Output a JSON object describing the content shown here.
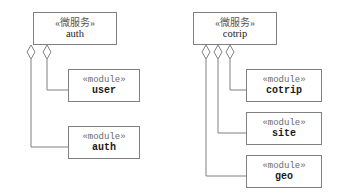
{
  "diagram": {
    "type": "uml-component-aggregation",
    "background_color": "#ffffff",
    "border_color": "#808080",
    "line_color": "#808080",
    "groups": [
      {
        "id": "auth-group",
        "service": {
          "stereotype": "«微服务»",
          "name": "auth",
          "box": {
            "x": 33,
            "y": 12,
            "w": 84,
            "h": 33
          }
        },
        "modules": [
          {
            "stereotype": "«module»",
            "name": "user",
            "box": {
              "x": 68,
              "y": 69,
              "w": 72,
              "h": 33
            },
            "diamond_x": 47,
            "drop_y": 90
          },
          {
            "stereotype": "«module»",
            "name": "auth",
            "box": {
              "x": 68,
              "y": 126,
              "w": 72,
              "h": 33
            },
            "diamond_x": 31,
            "drop_y": 147
          }
        ]
      },
      {
        "id": "cotrip-group",
        "service": {
          "stereotype": "«微服务»",
          "name": "cotrip",
          "box": {
            "x": 193,
            "y": 12,
            "w": 84,
            "h": 33
          },
          "label_color": "#222222"
        },
        "modules": [
          {
            "stereotype": "«module»",
            "name": "cotrip",
            "box": {
              "x": 246,
              "y": 69,
              "w": 76,
              "h": 33
            },
            "diamond_x": 230,
            "drop_y": 90
          },
          {
            "stereotype": "«module»",
            "name": "site",
            "box": {
              "x": 246,
              "y": 112,
              "w": 76,
              "h": 33
            },
            "diamond_x": 218,
            "drop_y": 133
          },
          {
            "stereotype": "«module»",
            "name": "geo",
            "box": {
              "x": 246,
              "y": 155,
              "w": 76,
              "h": 33
            },
            "diamond_x": 206,
            "drop_y": 176
          }
        ]
      }
    ],
    "aggregation_marker": {
      "shape": "hollow-diamond",
      "fill": "#ffffff",
      "stroke": "#808080",
      "half_width": 4,
      "height": 14
    }
  }
}
